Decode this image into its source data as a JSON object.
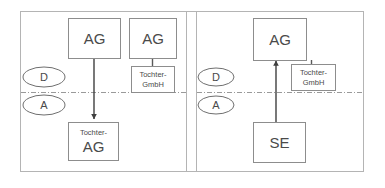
{
  "diagram": {
    "frame": {
      "x": 20,
      "y": 11,
      "width": 344,
      "height": 161
    },
    "panel_divider": {
      "x1": 186,
      "x2": 196,
      "y_top": 11,
      "y_bottom": 172
    },
    "regime_line": {
      "y": 92,
      "x1": 21,
      "x2": 363
    },
    "regime_markers": [
      {
        "id": "marker-d-left",
        "label": "D",
        "cx": 44,
        "cy": 77,
        "rx": 21,
        "ry": 10
      },
      {
        "id": "marker-a-left",
        "label": "A",
        "cx": 44,
        "cy": 105,
        "rx": 21,
        "ry": 10
      },
      {
        "id": "marker-d-right",
        "label": "D",
        "cx": 216,
        "cy": 77,
        "rx": 18,
        "ry": 9
      },
      {
        "id": "marker-a-right",
        "label": "A",
        "cx": 216,
        "cy": 105,
        "rx": 18,
        "ry": 9
      }
    ],
    "panels": [
      {
        "id": "panel-left",
        "nodes": [
          {
            "id": "node-left-ag-parent",
            "primary_label": "AG",
            "secondary_label": "",
            "x": 68,
            "y": 18,
            "width": 52,
            "height": 40,
            "label_size": "large"
          },
          {
            "id": "node-left-ag-second",
            "primary_label": "AG",
            "secondary_label": "",
            "x": 129,
            "y": 18,
            "width": 47,
            "height": 40,
            "label_size": "large"
          },
          {
            "id": "node-left-tochter-gmbh",
            "primary_label": "Tochter-",
            "secondary_label": "GmbH",
            "x": 131,
            "y": 66,
            "width": 43,
            "height": 26,
            "label_size": "small"
          },
          {
            "id": "node-left-tochter-ag",
            "primary_label": "Tochter-",
            "secondary_label": "AG",
            "x": 68,
            "y": 122,
            "width": 50,
            "height": 38,
            "label_size": "mixed"
          }
        ],
        "connectors": [
          {
            "id": "connector-left-ag-to-tochter-ag",
            "x1": 94,
            "y1": 58,
            "x2": 94,
            "y2": 120,
            "arrow": "down"
          },
          {
            "id": "connector-left-ag-to-gmbh",
            "x1": 152,
            "y1": 58,
            "x2": 152,
            "y2": 66,
            "arrow": "none"
          }
        ]
      },
      {
        "id": "panel-right",
        "nodes": [
          {
            "id": "node-right-ag-parent",
            "primary_label": "AG",
            "secondary_label": "",
            "x": 253,
            "y": 18,
            "width": 53,
            "height": 42,
            "label_size": "large"
          },
          {
            "id": "node-right-tochter-gmbh",
            "primary_label": "Tochter-",
            "secondary_label": "GmbH",
            "x": 291,
            "y": 64,
            "width": 44,
            "height": 26,
            "label_size": "small"
          },
          {
            "id": "node-right-se",
            "primary_label": "SE",
            "secondary_label": "",
            "x": 253,
            "y": 122,
            "width": 52,
            "height": 40,
            "label_size": "large"
          }
        ],
        "connectors": [
          {
            "id": "connector-right-se-to-ag",
            "x1": 276,
            "y1": 122,
            "x2": 276,
            "y2": 60,
            "arrow": "up"
          },
          {
            "id": "connector-right-ag-to-gmbh",
            "x1": 311,
            "y1": 60,
            "x2": 311,
            "y2": 64,
            "arrow": "none"
          }
        ]
      }
    ],
    "colors": {
      "frame_stroke": "#b4b4b4",
      "box_stroke": "#8d8d8d",
      "connector_stroke": "#3f3f3f",
      "regime_stroke": "#9a9a9a",
      "text": "#4a4a4a",
      "background": "#ffffff"
    }
  }
}
